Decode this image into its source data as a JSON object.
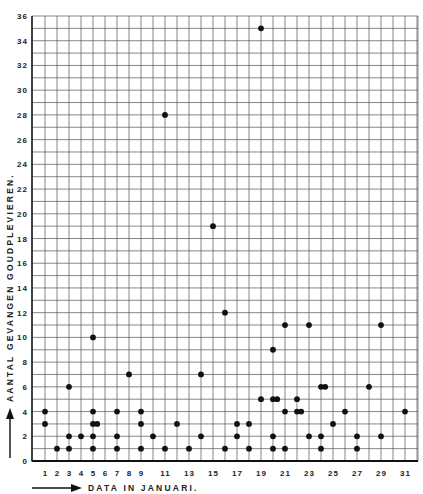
{
  "chart_data": {
    "type": "scatter",
    "title": "",
    "xlabel": "DATA IN JANUARI.",
    "ylabel": "AANTAL GEVANGEN GOUDPLEVIEREN.",
    "xlim": [
      0,
      32
    ],
    "ylim": [
      0,
      36
    ],
    "grid": true,
    "legend": null,
    "x_tick_labels": [
      "1",
      "2",
      "3",
      "4",
      "5",
      "6",
      "7",
      "8",
      "9",
      "11",
      "13",
      "15",
      "17",
      "19",
      "21",
      "23",
      "25",
      "27",
      "29",
      "31"
    ],
    "x_ticks": [
      1,
      2,
      3,
      4,
      5,
      6,
      7,
      8,
      9,
      11,
      13,
      15,
      17,
      19,
      21,
      23,
      25,
      27,
      29,
      31
    ],
    "y_ticks": [
      0,
      2,
      4,
      6,
      8,
      10,
      12,
      14,
      16,
      18,
      20,
      22,
      24,
      26,
      28,
      30,
      32,
      34,
      36
    ],
    "y_tick_labels": [
      "0",
      "2",
      "4",
      "6",
      "8",
      "10",
      "12",
      "14",
      "16",
      "18",
      "20",
      "22",
      "24",
      "26",
      "28",
      "30",
      "32",
      "34",
      "36"
    ],
    "points": [
      {
        "x": 1,
        "y": 3
      },
      {
        "x": 1,
        "y": 4
      },
      {
        "x": 2,
        "y": 1
      },
      {
        "x": 3,
        "y": 1
      },
      {
        "x": 3,
        "y": 2
      },
      {
        "x": 3,
        "y": 6
      },
      {
        "x": 4,
        "y": 2
      },
      {
        "x": 5,
        "y": 1
      },
      {
        "x": 5,
        "y": 2
      },
      {
        "x": 5,
        "y": 3
      },
      {
        "x": 5.35,
        "y": 3
      },
      {
        "x": 5,
        "y": 4
      },
      {
        "x": 5,
        "y": 10
      },
      {
        "x": 7,
        "y": 1
      },
      {
        "x": 7,
        "y": 2
      },
      {
        "x": 7,
        "y": 4
      },
      {
        "x": 8,
        "y": 7
      },
      {
        "x": 9,
        "y": 1
      },
      {
        "x": 9,
        "y": 3
      },
      {
        "x": 9,
        "y": 4
      },
      {
        "x": 10,
        "y": 2
      },
      {
        "x": 11,
        "y": 1
      },
      {
        "x": 11,
        "y": 28
      },
      {
        "x": 12,
        "y": 3
      },
      {
        "x": 13,
        "y": 1
      },
      {
        "x": 14,
        "y": 2
      },
      {
        "x": 14,
        "y": 7
      },
      {
        "x": 15,
        "y": 19
      },
      {
        "x": 16,
        "y": 1
      },
      {
        "x": 16,
        "y": 12
      },
      {
        "x": 17,
        "y": 2
      },
      {
        "x": 17,
        "y": 3
      },
      {
        "x": 18,
        "y": 1
      },
      {
        "x": 18,
        "y": 3
      },
      {
        "x": 19,
        "y": 5
      },
      {
        "x": 19,
        "y": 35
      },
      {
        "x": 20,
        "y": 1
      },
      {
        "x": 20,
        "y": 2
      },
      {
        "x": 20,
        "y": 5
      },
      {
        "x": 20.35,
        "y": 5
      },
      {
        "x": 20,
        "y": 9
      },
      {
        "x": 21,
        "y": 1
      },
      {
        "x": 21,
        "y": 4
      },
      {
        "x": 21,
        "y": 11
      },
      {
        "x": 22,
        "y": 4
      },
      {
        "x": 22.35,
        "y": 4
      },
      {
        "x": 22,
        "y": 5
      },
      {
        "x": 23,
        "y": 2
      },
      {
        "x": 23,
        "y": 11
      },
      {
        "x": 24,
        "y": 1
      },
      {
        "x": 24,
        "y": 2
      },
      {
        "x": 24,
        "y": 6
      },
      {
        "x": 24.35,
        "y": 6
      },
      {
        "x": 25,
        "y": 3
      },
      {
        "x": 26,
        "y": 4
      },
      {
        "x": 27,
        "y": 1
      },
      {
        "x": 27,
        "y": 2
      },
      {
        "x": 28,
        "y": 6
      },
      {
        "x": 29,
        "y": 2
      },
      {
        "x": 29,
        "y": 11
      },
      {
        "x": 31,
        "y": 4
      }
    ],
    "marker_color": "#111111",
    "grid_color": "#555555"
  }
}
